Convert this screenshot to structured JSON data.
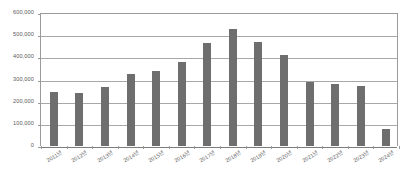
{
  "chart_data": {
    "type": "bar",
    "title": "",
    "subtitle": "",
    "xlabel": "",
    "ylabel": "",
    "categories": [
      "2011년",
      "2012년",
      "2013년",
      "2014년",
      "2015년",
      "2016년",
      "2017년",
      "2018년",
      "2019년",
      "2020년",
      "2021년",
      "2022년",
      "2023년",
      "2024년"
    ],
    "values": [
      245000,
      240000,
      267000,
      327000,
      337000,
      380000,
      463000,
      527000,
      467000,
      411000,
      288000,
      279000,
      273000,
      78000
    ],
    "ylim": [
      0,
      600000
    ],
    "ytick_values": [
      0,
      100000,
      200000,
      300000,
      400000,
      500000,
      600000
    ],
    "ytick_labels": [
      "0",
      "100,000",
      "200,000",
      "300,000",
      "400,000",
      "500,000",
      "600,000"
    ],
    "grid": true,
    "grid_axis": "y",
    "legend": false,
    "legend_position": "none",
    "series": [
      {
        "name": "",
        "values": [
          245000,
          240000,
          267000,
          327000,
          337000,
          380000,
          463000,
          527000,
          467000,
          411000,
          288000,
          279000,
          273000,
          78000
        ]
      }
    ]
  },
  "style": {
    "bar_color": "#6e6e6e",
    "gridline_color": "#a8a8a8",
    "axis_color": "#9a9a9a",
    "baseline_color": "#7d7d7d",
    "label_color": "#5a5a5a",
    "background_color": "#ffffff"
  }
}
